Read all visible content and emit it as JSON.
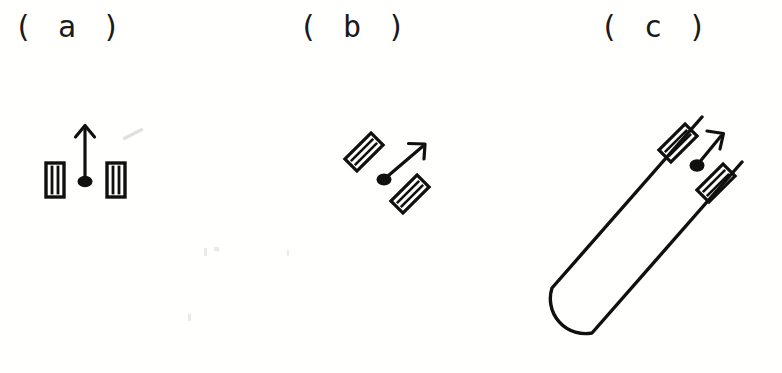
{
  "figure": {
    "width": 782,
    "height": 373,
    "background_color": "#fffffe",
    "ink_color": "#101010",
    "artifact_color": "#c9c9c9",
    "caption_font_size_px": 30
  },
  "panels": [
    {
      "id": "a",
      "label": "( a )",
      "description": "vertical arrow rising from a filled dot, flanked left and right by two upright ladder rectangles",
      "arrow": {
        "direction": "up",
        "angle_deg": 90,
        "tail": {
          "x": 85,
          "y": 180
        },
        "tip": {
          "x": 85,
          "y": 126
        },
        "head_style": "open-v"
      },
      "dot": {
        "x": 85,
        "y": 181,
        "rx": 7,
        "ry": 5.5,
        "filled": true
      },
      "plates": [
        {
          "name": "left-plate",
          "cx": 55,
          "cy": 180,
          "w": 18,
          "h": 34,
          "rotation_deg": 0,
          "internal_lines": 2
        },
        {
          "name": "right-plate",
          "cx": 116,
          "cy": 180,
          "w": 18,
          "h": 34,
          "rotation_deg": 0,
          "internal_lines": 2
        }
      ],
      "artifact": {
        "name": "scan-smudge",
        "x": 122,
        "y": 131,
        "w": 22,
        "h": 8,
        "rotation_deg": -28
      }
    },
    {
      "id": "b",
      "label": "( b )",
      "description": "diagonal arrow at forty-five degrees rising from a filled dot, flanked by two tilted ladder rectangles",
      "arrow": {
        "direction": "up-right",
        "angle_deg": 45,
        "tail": {
          "x": 385,
          "y": 178
        },
        "tip": {
          "x": 424,
          "y": 145
        },
        "head_style": "open-v"
      },
      "dot": {
        "x": 384,
        "y": 179,
        "rx": 7,
        "ry": 5.5,
        "filled": true
      },
      "plates": [
        {
          "name": "upper-left-plate",
          "cx": 364,
          "cy": 152,
          "w": 18,
          "h": 38,
          "rotation_deg": 45,
          "internal_lines": 2
        },
        {
          "name": "lower-right-plate",
          "cx": 410,
          "cy": 194,
          "w": 18,
          "h": 38,
          "rotation_deg": 45,
          "internal_lines": 2
        }
      ]
    },
    {
      "id": "c",
      "label": "( c )",
      "description": "elongated U-shaped hairpin tube tilted about forty-five degrees, with two ladder rectangles straddling the two tube arms near the open top, and a diagonal arrow rising from a filled dot between them",
      "tube": {
        "shape": "hairpin-capsule",
        "orientation_deg": 45,
        "open_end": "upper-right",
        "closed_end": "lower-left",
        "axis_start": {
          "x": 547,
          "y": 318
        },
        "axis_end": {
          "x": 718,
          "y": 128
        },
        "half_width": 27,
        "stroke_width": 3
      },
      "arrow": {
        "direction": "up-right",
        "angle_deg": 52,
        "tail": {
          "x": 698,
          "y": 163
        },
        "tip": {
          "x": 723,
          "y": 133
        },
        "head_style": "open-v"
      },
      "dot": {
        "x": 697,
        "y": 165,
        "rx": 7,
        "ry": 6,
        "filled": true
      },
      "plates": [
        {
          "name": "upper-left-plate",
          "cx": 678,
          "cy": 143,
          "w": 17,
          "h": 37,
          "rotation_deg": 45,
          "internal_lines": 2
        },
        {
          "name": "lower-right-plate",
          "cx": 716,
          "cy": 183,
          "w": 17,
          "h": 37,
          "rotation_deg": 45,
          "internal_lines": 2
        }
      ]
    }
  ]
}
